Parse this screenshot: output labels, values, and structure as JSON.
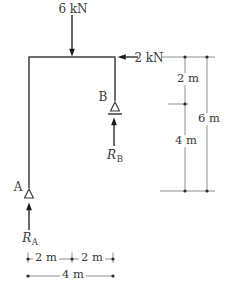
{
  "diagram": {
    "loads": {
      "top_load": "6 kN",
      "side_load": "2 kN"
    },
    "supports": {
      "a_label": "A",
      "b_label": "B"
    },
    "reactions": {
      "a": {
        "symbol": "R",
        "sub": "A"
      },
      "b": {
        "symbol": "R",
        "sub": "B"
      }
    },
    "dimensions": {
      "right_upper": "2 m",
      "right_lower": "4 m",
      "right_total": "6 m",
      "bottom_left": "2 m",
      "bottom_right": "2 m",
      "bottom_total": "4 m"
    },
    "colors": {
      "frame": "#3f3f3f",
      "dimension_line": "#8f8f8f",
      "dot": "#2b2b2b",
      "arrow": "#1c1c1c",
      "text": "#3a3a3a",
      "background": "#ffffff"
    }
  }
}
